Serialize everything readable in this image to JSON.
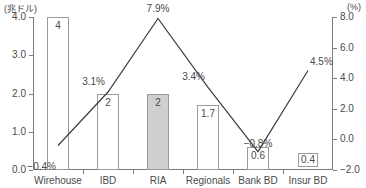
{
  "chart_data": {
    "type": "bar",
    "title": "",
    "subtitle": "",
    "xlabel": "",
    "ylabel": "(兆ドル)",
    "y2label": "(%)",
    "categories": [
      "Wirehouse",
      "IBD",
      "RIA",
      "Regionals",
      "Bank BD",
      "Insur BD"
    ],
    "grid": false,
    "legend_position": "none",
    "ylim": [
      0.0,
      4.0
    ],
    "y2lim": [
      -2.0,
      8.0
    ],
    "yticks": [
      "0.0",
      "1.0",
      "2.0",
      "3.0",
      "4.0"
    ],
    "ytick_values": [
      0.0,
      1.0,
      2.0,
      3.0,
      4.0
    ],
    "y2ticks": [
      "−2.0",
      "0.0",
      "2.0",
      "4.0",
      "6.0",
      "8.0"
    ],
    "y2tick_values": [
      -2.0,
      0.0,
      2.0,
      4.0,
      6.0,
      8.0
    ],
    "series": [
      {
        "name": "assets",
        "kind": "bar",
        "axis": "left",
        "unit": "兆ドル",
        "values": [
          4,
          2,
          2,
          1.7,
          0.6,
          0.4
        ],
        "labels": [
          "4",
          "2",
          "2",
          "1.7",
          "0.6",
          "0.4"
        ],
        "highlight_index": 2,
        "highlight_color": "#cfcfcf",
        "bar_color": "#ffffff",
        "bar_border_color": "#9a9a9a"
      },
      {
        "name": "growth",
        "kind": "line",
        "axis": "right",
        "unit": "%",
        "values": [
          -0.4,
          3.1,
          7.9,
          3.4,
          -0.8,
          4.5
        ],
        "labels": [
          "−0.4%",
          "3.1%",
          "7.9%",
          "3.4%",
          "−0.8%",
          "4.5%"
        ],
        "line_color": "#3d3d3d"
      }
    ]
  },
  "axes": {
    "left_unit_caption": "(兆ドル)",
    "right_unit_caption": "(%)"
  }
}
